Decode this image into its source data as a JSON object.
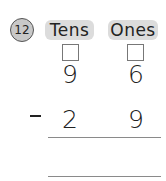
{
  "problem": {
    "number": "12",
    "columns": [
      {
        "label": "Tens"
      },
      {
        "label": "Ones"
      }
    ],
    "minuend": {
      "tens": "9",
      "ones": "6"
    },
    "operator": "-",
    "subtrahend": {
      "tens": "2",
      "ones": "9"
    },
    "answer": {
      "tens": "",
      "ones": ""
    }
  },
  "colors": {
    "circle_fill": "#c8c8c8",
    "pill_fill": "#dcdcdc",
    "line": "#8a8a8a"
  }
}
